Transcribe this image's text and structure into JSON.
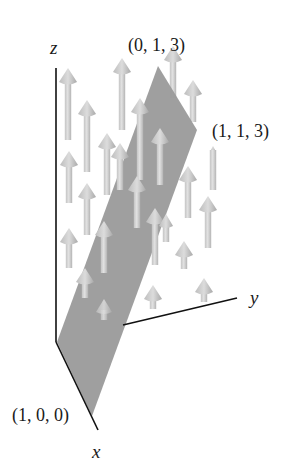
{
  "diagram": {
    "type": "3d-vector-field",
    "axes": {
      "x_label": "x",
      "y_label": "y",
      "z_label": "z"
    },
    "points": {
      "p100": "(1, 0, 0)",
      "p013": "(0, 1, 3)",
      "p113": "(1, 1, 3)"
    },
    "colors": {
      "plane": "#9a9a9a",
      "arrow": "#d2d2d2",
      "arrow_shade": "#b0b0b0",
      "axis": "#111111",
      "background": "#ffffff"
    }
  }
}
